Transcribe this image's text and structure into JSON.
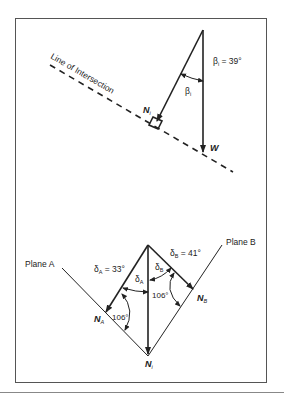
{
  "figure": {
    "top_panel": {
      "line_of_intersection_label": "Line of Intersection",
      "beta_label": "β",
      "beta_sub": "i",
      "beta_value_label": "β",
      "beta_value_sub": "i",
      "beta_value_text": " = 39°",
      "normal_label": "N",
      "normal_sub": "i",
      "weight_label": "W"
    },
    "bottom_panel": {
      "plane_a_label": "Plane A",
      "plane_b_label": "Plane B",
      "delta_a_value_label": "δ",
      "delta_a_value_sub": "A",
      "delta_a_value_text": " = 33°",
      "delta_b_value_label": "δ",
      "delta_b_value_sub": "B",
      "delta_b_value_text": " = 41°",
      "delta_a_label": "δ",
      "delta_a_sub": "A",
      "delta_b_label": "δ",
      "delta_b_sub": "B",
      "angle_a_text": "106°",
      "angle_b_text": "106°",
      "normal_a_label": "N",
      "normal_a_sub": "A",
      "normal_b_label": "N",
      "normal_b_sub": "B",
      "normal_i_label": "N",
      "normal_i_sub": "i"
    },
    "colors": {
      "stroke": "#222222",
      "frame": "#555555"
    }
  }
}
